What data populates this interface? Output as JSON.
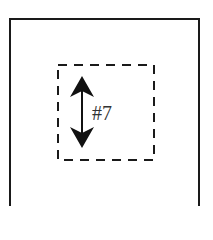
{
  "diagram": {
    "outer_box": {
      "stroke": "#1a1a1a",
      "style": "solid"
    },
    "inner_box": {
      "stroke": "#1a1a1a",
      "style": "dashed"
    },
    "arrow": {
      "type": "double-headed-vertical",
      "color": "#111111"
    },
    "label": "#7"
  }
}
